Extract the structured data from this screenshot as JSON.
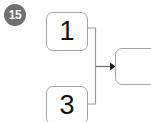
{
  "canvas": {
    "width": 151,
    "height": 122,
    "background": "#ffffff"
  },
  "badge": {
    "label": "15",
    "background_color": "#6f6f6f",
    "text_color": "#ffffff"
  },
  "diagram": {
    "type": "flow-merge",
    "line_color": "#9a9a9a",
    "arrow_color": "#1a1a1a",
    "node_border_color": "#a6a6a6",
    "node_fill": "#ffffff",
    "nodes": [
      {
        "id": "node-one",
        "label": "1",
        "role": "source-top"
      },
      {
        "id": "node-three",
        "label": "3",
        "role": "source-bottom"
      },
      {
        "id": "node-target",
        "label": "",
        "role": "target"
      }
    ],
    "edges": [
      {
        "from": "node-one",
        "to": "node-target",
        "style": "orthogonal",
        "arrowhead": true
      },
      {
        "from": "node-three",
        "to": "node-target",
        "style": "orthogonal",
        "arrowhead": true
      }
    ]
  }
}
